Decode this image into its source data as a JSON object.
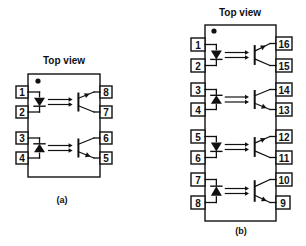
{
  "colors": {
    "ink": "#111111",
    "background": "#ffffff"
  },
  "packages": [
    {
      "id": "a",
      "title": "Top view",
      "caption": "(a)",
      "title_pos": [
        64,
        64
      ],
      "caption_pos": [
        62,
        203
      ],
      "body": {
        "x": 28,
        "y": 74,
        "w": 72,
        "h": 103
      },
      "dot": [
        38,
        81
      ],
      "pin_box": {
        "w": 12,
        "h": 12
      },
      "left_pins": [
        {
          "num": "1",
          "y": 86
        },
        {
          "num": "2",
          "y": 106
        },
        {
          "num": "3",
          "y": 132
        },
        {
          "num": "4",
          "y": 152
        }
      ],
      "right_pins": [
        {
          "num": "8",
          "y": 86
        },
        {
          "num": "7",
          "y": 106
        },
        {
          "num": "6",
          "y": 132
        },
        {
          "num": "5",
          "y": 152
        }
      ],
      "channels": [
        {
          "led_direction": "down",
          "emitter": "top",
          "top_pin_index": 0,
          "bottom_pin_index": 1
        },
        {
          "led_direction": "up",
          "emitter": "bottom",
          "top_pin_index": 2,
          "bottom_pin_index": 3
        }
      ]
    },
    {
      "id": "b",
      "title": "Top view",
      "caption": "(b)",
      "title_pos": [
        240,
        16
      ],
      "caption_pos": [
        241,
        234
      ],
      "body": {
        "x": 205,
        "y": 25,
        "w": 71,
        "h": 196
      },
      "dot": [
        214,
        31
      ],
      "pin_box": {
        "w": 14,
        "h": 13
      },
      "left_pins": [
        {
          "num": "1",
          "y": 38
        },
        {
          "num": "2",
          "y": 59
        },
        {
          "num": "3",
          "y": 83
        },
        {
          "num": "4",
          "y": 103
        },
        {
          "num": "5",
          "y": 130
        },
        {
          "num": "6",
          "y": 151
        },
        {
          "num": "7",
          "y": 173
        },
        {
          "num": "8",
          "y": 196
        }
      ],
      "right_pins": [
        {
          "num": "16",
          "y": 37
        },
        {
          "num": "15",
          "y": 59
        },
        {
          "num": "14",
          "y": 83
        },
        {
          "num": "13",
          "y": 103
        },
        {
          "num": "12",
          "y": 130
        },
        {
          "num": "11",
          "y": 151
        },
        {
          "num": "10",
          "y": 173
        },
        {
          "num": "9",
          "y": 196
        }
      ],
      "channels": [
        {
          "led_direction": "down",
          "emitter": "top",
          "top_pin_index": 0,
          "bottom_pin_index": 1
        },
        {
          "led_direction": "up",
          "emitter": "bottom",
          "top_pin_index": 2,
          "bottom_pin_index": 3
        },
        {
          "led_direction": "down",
          "emitter": "top",
          "top_pin_index": 4,
          "bottom_pin_index": 5
        },
        {
          "led_direction": "up",
          "emitter": "bottom",
          "top_pin_index": 6,
          "bottom_pin_index": 7
        }
      ]
    }
  ]
}
